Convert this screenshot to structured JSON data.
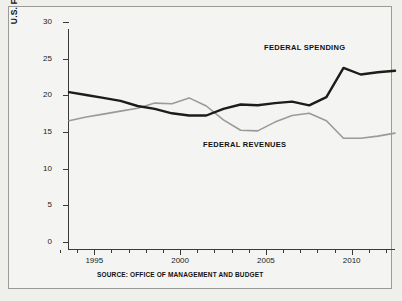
{
  "axis": {
    "y_label_main": "U.S. FEDERAL GOVERNMENT FINANCES",
    "y_label_sub": "(As a Percent of GDP)",
    "y_ticks": [
      "0",
      "5",
      "10",
      "15",
      "20",
      "25",
      "30"
    ],
    "x_ticks": [
      "1995",
      "2000",
      "2005",
      "2010"
    ]
  },
  "labels": {
    "spending": "FEDERAL SPENDING",
    "revenues": "FEDERAL REVENUES"
  },
  "source": "SOURCE: OFFICE OF MANAGEMENT AND BUDGET",
  "colors": {
    "spending": "#1c1c1c",
    "revenues": "#9a9a9a",
    "axis": "#3a3a3a",
    "background": "#efefec",
    "panel": "#f4f4f2"
  },
  "chart_data": {
    "type": "line",
    "title": "U.S. FEDERAL GOVERNMENT FINANCES",
    "subtitle": "(As a Percent of GDP)",
    "xlabel": "",
    "ylabel": "As a Percent of GDP",
    "xlim": [
      1993,
      2012
    ],
    "ylim": [
      0,
      30
    ],
    "grid": false,
    "legend": "inline-annotations",
    "x": [
      1993,
      1994,
      1995,
      1996,
      1997,
      1998,
      1999,
      2000,
      2001,
      2002,
      2003,
      2004,
      2005,
      2006,
      2007,
      2008,
      2009,
      2010,
      2011,
      2012
    ],
    "series": [
      {
        "name": "FEDERAL SPENDING",
        "color": "#1c1c1c",
        "values": [
          21.4,
          21.0,
          20.6,
          20.2,
          19.5,
          19.1,
          18.5,
          18.2,
          18.2,
          19.1,
          19.7,
          19.6,
          19.9,
          20.1,
          19.6,
          20.7,
          24.7,
          23.8,
          24.1,
          24.3
        ]
      },
      {
        "name": "FEDERAL REVENUES",
        "color": "#9a9a9a",
        "values": [
          17.5,
          18.0,
          18.4,
          18.8,
          19.2,
          19.9,
          19.8,
          20.6,
          19.5,
          17.6,
          16.2,
          16.1,
          17.3,
          18.2,
          18.5,
          17.5,
          15.1,
          15.1,
          15.4,
          15.8
        ]
      }
    ]
  }
}
